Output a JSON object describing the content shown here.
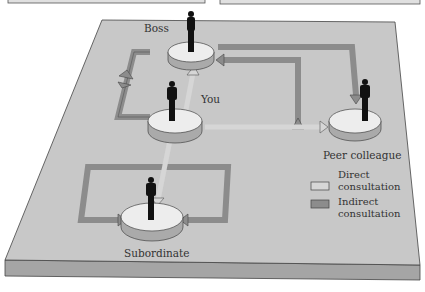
{
  "diagram": {
    "nodes": [
      {
        "id": "boss",
        "label": "Boss"
      },
      {
        "id": "you",
        "label": "You"
      },
      {
        "id": "peer",
        "label": "Peer colleague"
      },
      {
        "id": "subordinate",
        "label": "Subordinate"
      }
    ],
    "edges": [
      {
        "from": "you",
        "to": "boss",
        "type": "direct"
      },
      {
        "from": "you",
        "to": "peer",
        "type": "direct"
      },
      {
        "from": "you",
        "to": "subordinate",
        "type": "direct"
      },
      {
        "from": "you",
        "to": "boss",
        "type": "indirect",
        "via": "left loop"
      },
      {
        "from": "boss",
        "to": "you",
        "type": "indirect",
        "via": "left loop"
      },
      {
        "from": "boss",
        "to": "peer",
        "type": "indirect"
      },
      {
        "from": "you",
        "to": "boss",
        "type": "indirect",
        "via": "right loop"
      },
      {
        "from": "subordinate",
        "to": "subordinate",
        "type": "indirect",
        "via": "loop"
      }
    ],
    "legend": {
      "direct_line1": "Direct",
      "direct_line2": "consultation",
      "indirect_line1": "Indirect",
      "indirect_line2": "consultation"
    },
    "colors": {
      "platform_top": "#c8c8c8",
      "platform_side": "#a5a5a5",
      "direct_arrow": "#d6d6d6",
      "indirect_arrow": "#8c8c8c",
      "disc_top": "#ededed",
      "disc_side": "#aaaaaa",
      "figure": "#111111"
    }
  }
}
